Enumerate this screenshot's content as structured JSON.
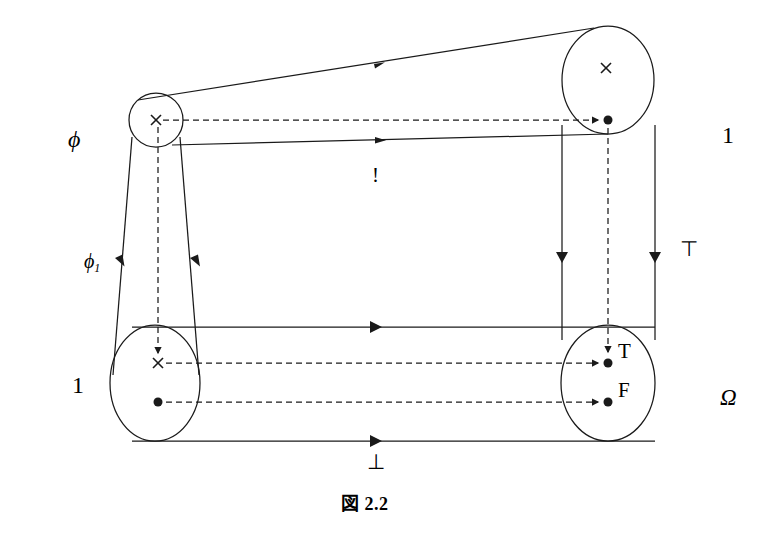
{
  "figure": {
    "caption": "図 2.2",
    "kind": "commutative-diagram"
  },
  "objects": {
    "top_left": {
      "label": "phi",
      "display": "ϕ",
      "point_marks": [
        "×"
      ]
    },
    "top_right": {
      "label": "one_top",
      "display": "1",
      "point_marks": [
        "×",
        "●"
      ]
    },
    "bottom_left": {
      "label": "one_bottom",
      "display": "1",
      "point_marks": [
        "×",
        "●"
      ]
    },
    "bottom_right": {
      "label": "omega",
      "display": "Ω",
      "point_marks": [
        "T",
        "F"
      ]
    }
  },
  "outer_labels": {
    "phi": "ϕ",
    "phi_one_base": "ϕ",
    "phi_one_sub": "1",
    "one_left": "1",
    "one_right": "1",
    "omega": "Ω"
  },
  "arrow_labels": {
    "bang": "!",
    "top_symbol": "⊤",
    "bottom_symbol": "⊥"
  },
  "element_labels": {
    "true_point": "T",
    "false_point": "F"
  },
  "colors": {
    "stroke": "#1a1a1a",
    "background": "#ffffff",
    "text": "#000000"
  }
}
